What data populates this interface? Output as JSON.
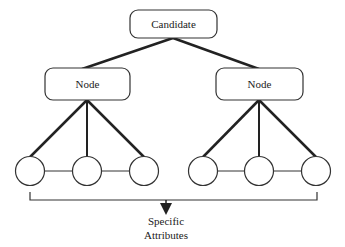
{
  "diagram": {
    "root": {
      "label": "Candidate"
    },
    "nodes": [
      {
        "label": "Node"
      },
      {
        "label": "Node"
      }
    ],
    "leaves_per_node": 3,
    "output": {
      "line1": "Specific",
      "line2": "Attributes"
    }
  },
  "colors": {
    "stroke": "#222222",
    "background": "#ffffff"
  }
}
